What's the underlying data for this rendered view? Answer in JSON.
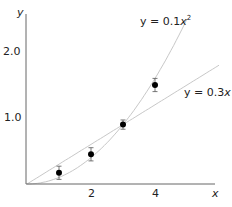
{
  "chart_data": {
    "type": "scatter",
    "title": "",
    "xlabel": "x",
    "ylabel": "y",
    "xlim": [
      0,
      5.8
    ],
    "ylim": [
      0,
      2.6
    ],
    "x_ticks": [
      {
        "value": 2,
        "label": "2"
      },
      {
        "value": 4,
        "label": "4"
      }
    ],
    "y_ticks": [
      {
        "value": 1.0,
        "label": "1.0"
      },
      {
        "value": 2.0,
        "label": "2.0"
      }
    ],
    "grid": false,
    "legend": null,
    "series": [
      {
        "name": "observations",
        "kind": "points_with_error_bars",
        "x": [
          1,
          2,
          3,
          4
        ],
        "y": [
          0.17,
          0.45,
          0.9,
          1.5
        ],
        "error": [
          0.1,
          0.1,
          0.07,
          0.1
        ],
        "color": "#000000"
      },
      {
        "name": "y = 0.1x²",
        "kind": "curve",
        "formula": "0.1*x^2",
        "x_range": [
          0,
          5.0
        ],
        "color": "#c8c8c8"
      },
      {
        "name": "y = 0.3x",
        "kind": "line",
        "formula": "0.3*x",
        "x_range": [
          0,
          6.0
        ],
        "color": "#c8c8c8"
      }
    ],
    "annotations": [
      {
        "text": "y = 0.1x",
        "sup": "2",
        "near_series": "y = 0.1x²"
      },
      {
        "text": "y = 0.3",
        "italic_suffix": "x",
        "near_series": "y = 0.3x"
      }
    ]
  },
  "labels": {
    "y_axis": "y",
    "x_axis": "x",
    "tick_x_2": "2",
    "tick_x_4": "4",
    "tick_y_1": "1.0",
    "tick_y_2": "2.0",
    "curve_quad_prefix": "y = 0.1",
    "curve_quad_var": "x",
    "curve_quad_sup": "2",
    "curve_lin_prefix": "y = 0.3",
    "curve_lin_var": "x"
  },
  "colors": {
    "axis": "#666666",
    "curve": "#c8c8c8",
    "point": "#000000"
  }
}
